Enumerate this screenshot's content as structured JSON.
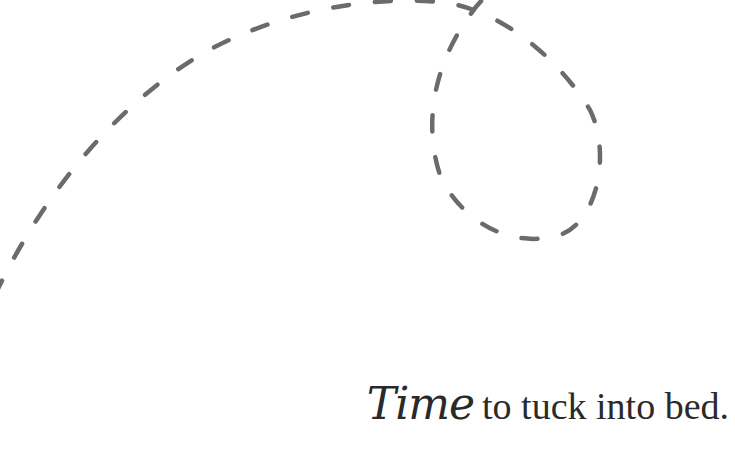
{
  "illustration": {
    "description": "dashed looping path",
    "stroke_color": "#6b6b6b"
  },
  "caption": {
    "script_word": "Time",
    "rest": "to tuck into bed."
  }
}
